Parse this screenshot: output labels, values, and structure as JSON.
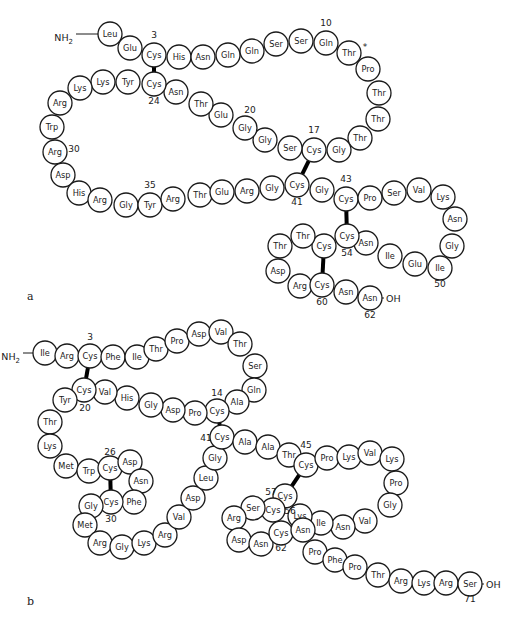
{
  "diagram": {
    "type": "protein_primary_structure",
    "panels": [
      {
        "label": "a",
        "n_terminus": "NH2",
        "c_terminus": "OH",
        "residues": [
          "Leu",
          "Glu",
          "Cys",
          "His",
          "Asn",
          "Gln",
          "Gln",
          "Ser",
          "Ser",
          "Gln",
          "Thr",
          "Pro",
          "Thr",
          "Thr",
          "Thr",
          "Gly",
          "Cys",
          "Ser",
          "Gly",
          "Gly",
          "Glu",
          "Thr",
          "Asn",
          "Cys",
          "Tyr",
          "Lys",
          "Lys",
          "Arg",
          "Trp",
          "Arg",
          "Asp",
          "His",
          "Arg",
          "Gly",
          "Tyr",
          "Arg",
          "Thr",
          "Glu",
          "Arg",
          "Gly",
          "Cys",
          "Gly",
          "Cys",
          "Pro",
          "Ser",
          "Val",
          "Lys",
          "Asn",
          "Gly",
          "Ile",
          "Glu",
          "Ile",
          "Asn",
          "Cys",
          "Cys",
          "Thr",
          "Thr",
          "Asp",
          "Arg",
          "Cys",
          "Asn",
          "Asn"
        ],
        "position_labels": [
          "3",
          "10",
          "17",
          "20",
          "24",
          "30",
          "35",
          "41",
          "43",
          "50",
          "54",
          "60",
          "62"
        ],
        "disulfide_bonds": [
          [
            3,
            24
          ],
          [
            17,
            41
          ],
          [
            43,
            54
          ],
          [
            55,
            60
          ]
        ],
        "marker": "*"
      },
      {
        "label": "b",
        "n_terminus": "NH2",
        "c_terminus": "OH",
        "residues": [
          "Ile",
          "Arg",
          "Cys",
          "Phe",
          "Ile",
          "Thr",
          "Pro",
          "Asp",
          "Val",
          "Thr",
          "Ser",
          "Gln",
          "Ala",
          "Cys",
          "Pro",
          "Asp",
          "Gly",
          "His",
          "Val",
          "Cys",
          "Tyr",
          "Thr",
          "Lys",
          "Met",
          "Trp",
          "Cys",
          "Asp",
          "Asn",
          "Phe",
          "Cys",
          "Gly",
          "Met",
          "Arg",
          "Gly",
          "Lys",
          "Arg",
          "Val",
          "Asp",
          "Leu",
          "Gly",
          "Cys",
          "Ala",
          "Ala",
          "Thr",
          "Cys",
          "Pro",
          "Lys",
          "Val",
          "Lys",
          "Pro",
          "Gly",
          "Val",
          "Asn",
          "Ile",
          "Lys",
          "Cys",
          "Cys",
          "Ser",
          "Arg",
          "Asp",
          "Asn",
          "Cys",
          "Asn",
          "Pro",
          "Phe",
          "Pro",
          "Thr",
          "Arg",
          "Lys",
          "Arg",
          "Ser"
        ],
        "position_labels": [
          "3",
          "14",
          "20",
          "26",
          "30",
          "41",
          "45",
          "56",
          "57",
          "62",
          "71"
        ],
        "disulfide_bonds": [
          [
            3,
            20
          ],
          [
            14,
            41
          ],
          [
            26,
            30
          ],
          [
            45,
            56
          ],
          [
            57,
            62
          ]
        ]
      }
    ]
  }
}
